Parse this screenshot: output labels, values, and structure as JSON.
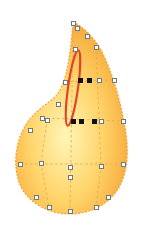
{
  "canvas": {
    "width": 143,
    "height": 238,
    "background": "#ffffff"
  },
  "shape": {
    "kind": "teardrop-mesh",
    "fill_gradient": {
      "center": "#fff6b8",
      "mid": "#ffd46a",
      "edge": "#f6a93a"
    },
    "outline_color": "#f2a43a",
    "grid_line_color": "#e9a64c",
    "path": "M73,22 C82,26 96,38 104,56 C114,78 120,100 124,122 C130,150 128,176 116,192 C104,208 86,214 70,214 C52,214 34,206 24,192 C12,174 14,146 24,128 C32,112 48,104 56,96 C66,84 70,60 73,22 Z"
  },
  "grid_lines": [
    {
      "x1": 73,
      "y1": 30,
      "x2": 70,
      "y2": 212
    },
    {
      "x1": 96,
      "y1": 47,
      "x2": 101,
      "y2": 166
    },
    {
      "x1": 101,
      "y1": 166,
      "x2": 96,
      "y2": 207
    },
    {
      "x1": 47,
      "y1": 120,
      "x2": 41,
      "y2": 163
    },
    {
      "x1": 41,
      "y1": 163,
      "x2": 49,
      "y2": 207
    },
    {
      "x1": 65,
      "y1": 82,
      "x2": 114,
      "y2": 80
    },
    {
      "x1": 42,
      "y1": 118,
      "x2": 123,
      "y2": 121
    },
    {
      "x1": 20,
      "y1": 164,
      "x2": 123,
      "y2": 164
    }
  ],
  "selection_ellipse": {
    "cx": 73,
    "cy": 88,
    "rx": 5,
    "ry": 38,
    "rotate": 8,
    "stroke": "#e0452a",
    "stroke_width": 2.2
  },
  "handles": [
    {
      "x": 73,
      "y": 23,
      "selected": false
    },
    {
      "x": 77,
      "y": 28,
      "selected": false
    },
    {
      "x": 87,
      "y": 36,
      "selected": false
    },
    {
      "x": 96,
      "y": 47,
      "selected": false
    },
    {
      "x": 75,
      "y": 49,
      "selected": false
    },
    {
      "x": 65,
      "y": 82,
      "selected": false
    },
    {
      "x": 80,
      "y": 80,
      "selected": true
    },
    {
      "x": 89,
      "y": 80,
      "selected": true
    },
    {
      "x": 99,
      "y": 80,
      "selected": false
    },
    {
      "x": 114,
      "y": 80,
      "selected": false
    },
    {
      "x": 58,
      "y": 104,
      "selected": false
    },
    {
      "x": 42,
      "y": 118,
      "selected": false
    },
    {
      "x": 47,
      "y": 120,
      "selected": false
    },
    {
      "x": 73,
      "y": 121,
      "selected": true
    },
    {
      "x": 81,
      "y": 121,
      "selected": true
    },
    {
      "x": 94,
      "y": 121,
      "selected": true
    },
    {
      "x": 101,
      "y": 121,
      "selected": false
    },
    {
      "x": 123,
      "y": 121,
      "selected": false
    },
    {
      "x": 30,
      "y": 130,
      "selected": false
    },
    {
      "x": 20,
      "y": 164,
      "selected": false
    },
    {
      "x": 41,
      "y": 163,
      "selected": false
    },
    {
      "x": 70,
      "y": 167,
      "selected": false
    },
    {
      "x": 70,
      "y": 177,
      "selected": false
    },
    {
      "x": 101,
      "y": 166,
      "selected": false
    },
    {
      "x": 123,
      "y": 164,
      "selected": false
    },
    {
      "x": 36,
      "y": 197,
      "selected": false
    },
    {
      "x": 108,
      "y": 197,
      "selected": false
    },
    {
      "x": 49,
      "y": 207,
      "selected": false
    },
    {
      "x": 96,
      "y": 207,
      "selected": false
    },
    {
      "x": 70,
      "y": 211,
      "selected": false
    }
  ]
}
